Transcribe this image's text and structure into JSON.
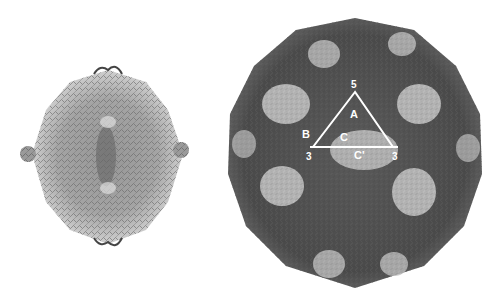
{
  "figure": {
    "left_panel": {
      "description": "Small capsid rendering, ribbon trace, light grey"
    },
    "right_panel": {
      "description": "Large capsid rendering, dark grey with light-grey protrusions",
      "annotation_triangle": {
        "color": "#ffffff",
        "vertices": {
          "top": "5",
          "bottom_left": "3",
          "bottom_right": "3"
        },
        "labels": {
          "A": "A",
          "B": "B",
          "C_upper": "C",
          "C_lower": "C'"
        }
      }
    }
  },
  "colors": {
    "background": "#ffffff",
    "capsid_dark": "#4a4a4a",
    "capsid_mid": "#6e6e6e",
    "capsid_light": "#c8c8c8"
  }
}
